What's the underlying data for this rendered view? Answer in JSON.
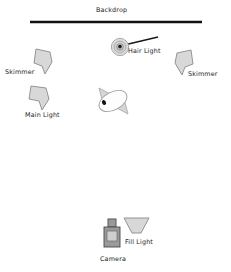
{
  "diagram": {
    "background_color": "#ffffff",
    "width": 231,
    "height": 272,
    "labels": {
      "backdrop": "Backdrop",
      "hair_light": "Hair Light",
      "skimmer_left": "Skimmer",
      "skimmer_right": "Skimmer",
      "main_light": "Main Light",
      "fill_light": "Fill Light",
      "camera": "Camera"
    },
    "colors": {
      "line": "#111111",
      "text": "#1c1c1c",
      "softbox_fill": "#d8d8d8",
      "softbox_stroke": "#8a8a8a",
      "camera_body": "#9a9a9a",
      "camera_stroke": "#4a4a4a",
      "camera_inner": "#cfcfcf",
      "subject_fill": "#fdfdfd",
      "subject_shoulder": "#d6d6d6",
      "subject_stroke": "#9b9b9b",
      "nose_dot": "#111111",
      "hair_ring": "#9e9e9e"
    },
    "elements": {
      "backdrop_line": {
        "x1": 30,
        "y1": 22,
        "x2": 202,
        "y2": 22,
        "thickness": 2.6
      },
      "hair_light": {
        "cx": 120,
        "cy": 47,
        "r": 9,
        "boom_x2": 158,
        "boom_y2": 37
      },
      "skimmer_left": {
        "cx": 42,
        "cy": 60
      },
      "skimmer_right": {
        "cx": 185,
        "cy": 62
      },
      "main_light": {
        "cx": 39,
        "cy": 97
      },
      "subject": {
        "cx": 113,
        "cy": 101,
        "rx": 15,
        "ry": 9,
        "rotation": -28
      },
      "fill_light": {
        "cx": 136,
        "cy": 227
      },
      "camera": {
        "cx": 112,
        "cy": 235
      }
    }
  }
}
